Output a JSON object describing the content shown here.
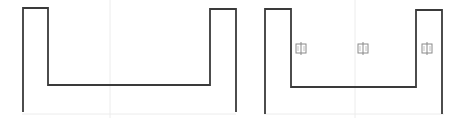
{
  "diagram": {
    "background": "#ffffff",
    "stroke_color": "#3a3a3a",
    "grid_color": "#ececec",
    "icon_color": "#8a8a8a",
    "panels": [
      {
        "id": "left",
        "shape": "u-channel-profile",
        "icons": []
      },
      {
        "id": "right",
        "shape": "u-channel-profile",
        "icons": [
          {
            "name": "door-icon",
            "glyph": "中"
          },
          {
            "name": "door-icon",
            "glyph": "中"
          },
          {
            "name": "door-icon",
            "glyph": "中"
          }
        ]
      }
    ]
  }
}
